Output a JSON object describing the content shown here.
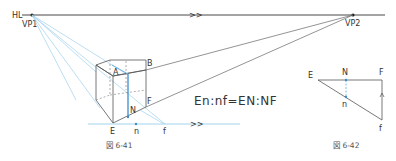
{
  "colors": {
    "line": "#555555",
    "horizon": "#333333",
    "blue": "#6fb6e0",
    "blue_dark": "#3a8fd0",
    "text": "#333333"
  },
  "figure_41": {
    "horizon_label": "HL",
    "vp1_label": "VP1",
    "vp2_label": "VP2",
    "horizon_marker": ">>",
    "ground_marker": ">>",
    "points": {
      "A": "A",
      "B": "B",
      "E": "E",
      "F": "F",
      "N": "N",
      "n": "n",
      "f": "f"
    },
    "equation": "En:nf=EN:NF",
    "caption": "図 6-41"
  },
  "figure_42": {
    "points": {
      "E": "E",
      "N": "N",
      "F": "F",
      "n": "n",
      "f": "f"
    },
    "caption": "図 6-42"
  }
}
